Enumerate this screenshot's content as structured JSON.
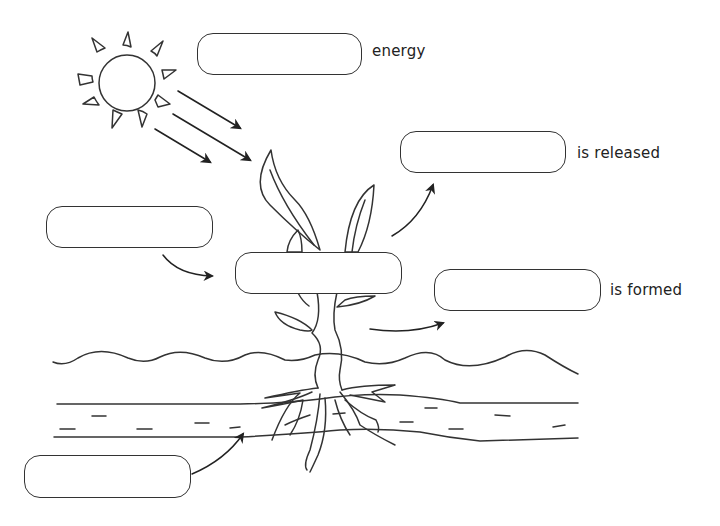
{
  "diagram": {
    "labels": {
      "energy": "energy",
      "released": "is released",
      "formed": "is formed"
    },
    "boxes": [
      {
        "id": "light-energy-box",
        "value": ""
      },
      {
        "id": "released-gas-box",
        "value": ""
      },
      {
        "id": "input-gas-box",
        "value": ""
      },
      {
        "id": "process-box",
        "value": ""
      },
      {
        "id": "formed-product-box",
        "value": ""
      },
      {
        "id": "water-box",
        "value": ""
      }
    ],
    "elements": [
      "sun",
      "light-rays",
      "plant",
      "leaves",
      "stem",
      "roots",
      "soil-surface",
      "water-layer"
    ]
  }
}
